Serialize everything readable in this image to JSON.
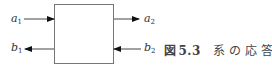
{
  "diagram": {
    "block": {
      "x": 54,
      "y": 4,
      "width": 59,
      "height": 60,
      "stroke": "#666666"
    },
    "ports": [
      {
        "id": "a1",
        "base": "a",
        "sub": "1",
        "side": "left",
        "direction": "in",
        "y": 19
      },
      {
        "id": "b1",
        "base": "b",
        "sub": "1",
        "side": "left",
        "direction": "out",
        "y": 49
      },
      {
        "id": "a2",
        "base": "a",
        "sub": "2",
        "side": "right",
        "direction": "out",
        "y": 19
      },
      {
        "id": "b2",
        "base": "b",
        "sub": "2",
        "side": "right",
        "direction": "in",
        "y": 49
      }
    ]
  },
  "caption": {
    "figure_label": "図",
    "figure_number": "5.3",
    "text": "系の応答"
  }
}
